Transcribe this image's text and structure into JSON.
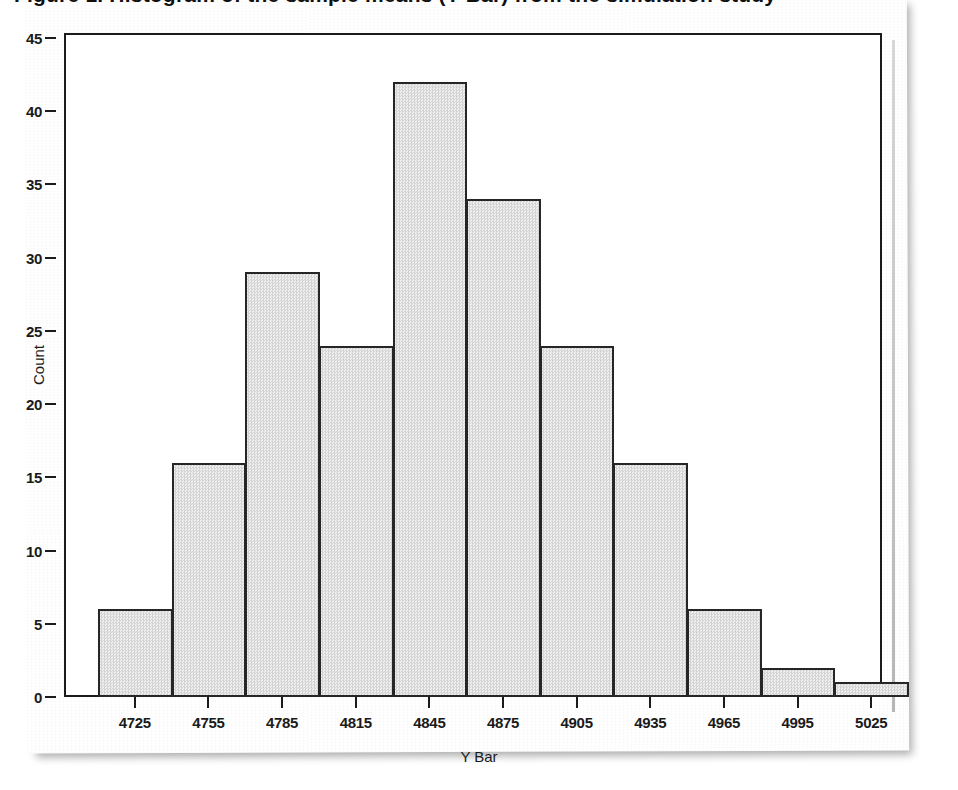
{
  "figure": {
    "title": "Figure 1. Histogram of the sample means (Y Bar) from the simulation study",
    "title_cropped": true
  },
  "chart_data": {
    "type": "bar",
    "title": "",
    "xlabel": "Y Bar",
    "ylabel": "Count",
    "categories": [
      "4725",
      "4755",
      "4785",
      "4815",
      "4845",
      "4875",
      "4905",
      "4935",
      "4965",
      "4995",
      "5025"
    ],
    "values": [
      6,
      16,
      29,
      24,
      42,
      34,
      24,
      16,
      6,
      2,
      1
    ],
    "x_tick_labels": [
      "4725",
      "4755",
      "4785",
      "4815",
      "4845",
      "4875",
      "4905",
      "4935",
      "4965",
      "4995",
      "5025"
    ],
    "y_tick_labels": [
      "0",
      "5",
      "10",
      "15",
      "20",
      "25",
      "30",
      "35",
      "40",
      "45"
    ],
    "y_ticks": [
      0,
      5,
      10,
      15,
      20,
      25,
      30,
      35,
      40,
      45
    ],
    "ylim": [
      0,
      45
    ],
    "bin_width": 30,
    "grid": false,
    "legend": false,
    "bar_fill_color": "#e2e2e2",
    "bar_edge_color": "#262626",
    "axis_color": "#1b1b1b",
    "background_color": "#ffffff"
  }
}
